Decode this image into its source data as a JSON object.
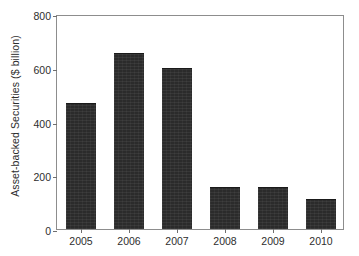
{
  "chart_data": {
    "type": "bar",
    "title": "",
    "subtitle": "",
    "xlabel": "",
    "ylabel": "Asset-backed Securities ($ billion)",
    "categories": [
      "2005",
      "2006",
      "2007",
      "2008",
      "2009",
      "2010"
    ],
    "values": [
      470,
      655,
      600,
      155,
      155,
      110
    ],
    "series": [
      {
        "name": "Asset-backed Securities",
        "values": [
          470,
          655,
          600,
          155,
          155,
          110
        ]
      }
    ],
    "ylim": [
      0,
      800
    ],
    "ytick_labels": [
      "0",
      "200",
      "400",
      "600",
      "800"
    ],
    "ytick_values": [
      0,
      200,
      400,
      600,
      800
    ],
    "xtick_labels": [
      "2005",
      "2006",
      "2007",
      "2008",
      "2009",
      "2010"
    ],
    "grid": false,
    "legend": null,
    "legend_position": "none",
    "annotations": [],
    "bar_color": "#2b2b2b",
    "axis_color": "#8d8d8d",
    "text_color": "#2e2e2e",
    "background_color": "#ffffff"
  }
}
